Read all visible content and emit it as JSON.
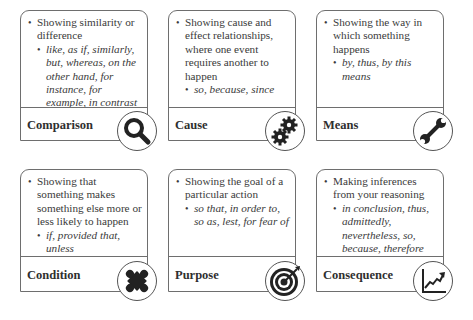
{
  "cards": [
    {
      "title": "Comparison",
      "description": "Showing similarity or difference",
      "examples": "like, as if, similarly, but, whereas, on the other hand, for instance, for example, in contrast",
      "icon": "magnifying-glass-icon"
    },
    {
      "title": "Cause",
      "description": "Showing cause and effect relationships, where one event requires another to happen",
      "examples": "so, because, since",
      "icon": "gears-icon"
    },
    {
      "title": "Means",
      "description": "Showing the way in which something happens",
      "examples": "by, thus, by this means",
      "icon": "wrench-icon"
    },
    {
      "title": "Condition",
      "description": "Showing that something makes something else more or less likely to happen",
      "examples": "if, provided that, unless",
      "icon": "puzzle-piece-icon"
    },
    {
      "title": "Purpose",
      "description": "Showing the goal of a particular action",
      "examples": "so that, in order to, so as, lest, for fear of",
      "icon": "target-icon"
    },
    {
      "title": "Consequence",
      "description": "Making inferences from your reasoning",
      "examples": "in conclusion, thus, admittedly, nevertheless, so, because, therefore",
      "icon": "trend-chart-icon"
    }
  ],
  "colors": {
    "border": "#6e6e6e",
    "icon": "#222222",
    "text": "#3a3a3a"
  }
}
